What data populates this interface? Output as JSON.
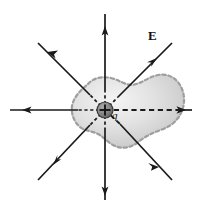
{
  "figure": {
    "name": "gauss-law-point-charge-field-diagram",
    "background_color": "#ffffff",
    "width": 198,
    "height": 206
  },
  "labels": {
    "field_label": "E",
    "charge_label": "q",
    "charge_sign": "+"
  },
  "colors": {
    "line": "#1a1a1a",
    "charge_fill": "#808080",
    "charge_stroke": "#2b2b2b",
    "surface_fill_light": "#f0f0f0",
    "surface_fill_mid": "#d8d8d8",
    "surface_fill_dark": "#bdbdbd",
    "surface_stroke": "#9a9a9a"
  },
  "center": {
    "x": 105,
    "y": 110
  },
  "field_lines": [
    {
      "name": "field-line-up",
      "angle_deg": 90,
      "tip_x": 105,
      "tip_y": 14,
      "arrow_at": 0.82,
      "dashed_inside": true
    },
    {
      "name": "field-line-down",
      "angle_deg": 270,
      "tip_x": 105,
      "tip_y": 200,
      "arrow_at": 0.8,
      "dashed_inside": true
    },
    {
      "name": "field-line-left",
      "angle_deg": 180,
      "tip_x": 10,
      "tip_y": 110,
      "arrow_at": 0.8,
      "dashed_inside": true
    },
    {
      "name": "field-line-right",
      "angle_deg": 0,
      "tip_x": 192,
      "tip_y": 110,
      "arrow_at": 0.92,
      "dashed_inside": true
    },
    {
      "name": "field-line-upper-left",
      "angle_deg": 135,
      "tip_x": 38,
      "tip_y": 43,
      "arrow_at": 0.72,
      "dashed_inside": true
    },
    {
      "name": "field-line-upper-right",
      "angle_deg": 45,
      "tip_x": 172,
      "tip_y": 43,
      "arrow_at": 0.66,
      "dashed_inside": true
    },
    {
      "name": "field-line-lower-left",
      "angle_deg": 225,
      "tip_x": 38,
      "tip_y": 180,
      "arrow_at": 0.72,
      "dashed_inside": true
    },
    {
      "name": "field-line-lower-right",
      "angle_deg": 315,
      "tip_x": 172,
      "tip_y": 180,
      "arrow_at": 0.7,
      "dashed_inside": true
    }
  ],
  "gaussian_surface": {
    "name": "gaussian-surface-blob",
    "style": "dashed irregular closed surface",
    "path": "M 88 84 C 93 79 101 77 110 79 C 118 81 124 86 131 86 C 140 85 147 79 157 77 C 167 75 176 80 180 89 C 184 98 183 108 178 116 C 174 123 167 127 159 130 C 151 133 144 137 138 141 C 131 146 124 148 117 146 C 110 144 106 138 100 135 C 94 132 87 132 82 128 C 76 123 73 116 74 108 C 75 99 81 90 88 84 Z"
  },
  "charge": {
    "name": "point-charge",
    "x": 105,
    "y": 110,
    "radius": 8
  }
}
